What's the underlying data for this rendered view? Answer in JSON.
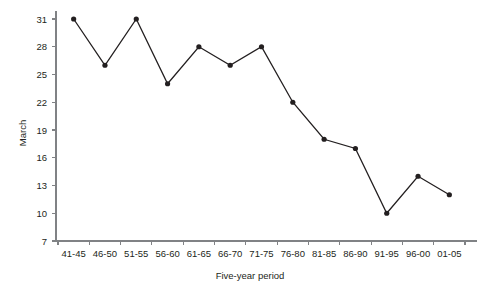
{
  "chart_data": {
    "type": "line",
    "title": "",
    "xlabel": "Five-year period",
    "ylabel": "March",
    "categories": [
      "41-45",
      "46-50",
      "51-55",
      "56-60",
      "61-65",
      "66-70",
      "71-75",
      "76-80",
      "81-85",
      "86-90",
      "91-95",
      "96-00",
      "01-05"
    ],
    "values": [
      31,
      26,
      31,
      24,
      28,
      26,
      28,
      22,
      18,
      17,
      10,
      14,
      12
    ],
    "series": [
      {
        "name": "March",
        "values": [
          31,
          26,
          31,
          24,
          28,
          26,
          28,
          22,
          18,
          17,
          10,
          14,
          12
        ]
      }
    ],
    "ylim": [
      7,
      31
    ],
    "yticks": [
      7,
      10,
      13,
      16,
      19,
      22,
      25,
      28,
      31
    ],
    "ytick_labels": [
      "7",
      "10",
      "13",
      "16",
      "19",
      "22",
      "25",
      "28",
      "31"
    ],
    "grid": false,
    "legend": false,
    "legend_position": "none",
    "marker": "filled-circle",
    "line_color": "#231f20",
    "axis_color": "#808285",
    "background_color": "#ffffff"
  }
}
